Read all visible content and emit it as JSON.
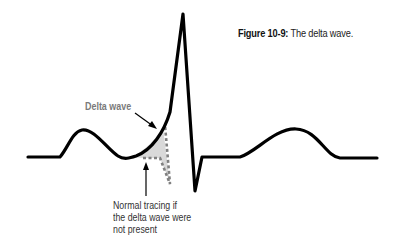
{
  "caption": {
    "number": "Figure 10-9:",
    "title": "The delta wave."
  },
  "labels": {
    "delta_wave": "Delta wave",
    "normal_tracing": [
      "Normal tracing if",
      "the delta wave were",
      "not present"
    ]
  },
  "colors": {
    "trace": "#000000",
    "delta_label": "#7a7a7a",
    "dotted_outline": "#808080",
    "shaded_area": "#d9d9d9",
    "background": "#ffffff"
  },
  "icons": {
    "delta_pointer": "arrow-diagonal-down-right",
    "normal_pointer": "arrow-up"
  }
}
